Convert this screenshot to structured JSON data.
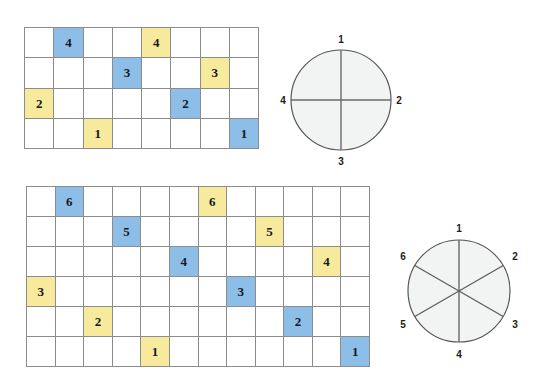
{
  "figure": {
    "palette": {
      "blue_fill": "#8cbee8",
      "yellow_fill": "#f8ea9d",
      "grid_line": "#8c8c8c",
      "circle_line": "#555555",
      "circle_fill": "#f2f4f4",
      "digit_color": "#15171c",
      "background": "#ffffff"
    }
  },
  "grid_top": {
    "name": "fourths-grid",
    "columns": 8,
    "rows": 4,
    "cells": [
      {
        "row": 1,
        "col": 1,
        "value": "",
        "fill": "none"
      },
      {
        "row": 1,
        "col": 2,
        "value": "4",
        "fill": "blue"
      },
      {
        "row": 1,
        "col": 3,
        "value": "",
        "fill": "none"
      },
      {
        "row": 1,
        "col": 4,
        "value": "",
        "fill": "none"
      },
      {
        "row": 1,
        "col": 5,
        "value": "4",
        "fill": "yellow"
      },
      {
        "row": 1,
        "col": 6,
        "value": "",
        "fill": "none"
      },
      {
        "row": 1,
        "col": 7,
        "value": "",
        "fill": "none"
      },
      {
        "row": 1,
        "col": 8,
        "value": "",
        "fill": "none"
      },
      {
        "row": 2,
        "col": 1,
        "value": "",
        "fill": "none"
      },
      {
        "row": 2,
        "col": 2,
        "value": "",
        "fill": "none"
      },
      {
        "row": 2,
        "col": 3,
        "value": "",
        "fill": "none"
      },
      {
        "row": 2,
        "col": 4,
        "value": "3",
        "fill": "blue"
      },
      {
        "row": 2,
        "col": 5,
        "value": "",
        "fill": "none"
      },
      {
        "row": 2,
        "col": 6,
        "value": "",
        "fill": "none"
      },
      {
        "row": 2,
        "col": 7,
        "value": "3",
        "fill": "yellow"
      },
      {
        "row": 2,
        "col": 8,
        "value": "",
        "fill": "none"
      },
      {
        "row": 3,
        "col": 1,
        "value": "2",
        "fill": "yellow"
      },
      {
        "row": 3,
        "col": 2,
        "value": "",
        "fill": "none"
      },
      {
        "row": 3,
        "col": 3,
        "value": "",
        "fill": "none"
      },
      {
        "row": 3,
        "col": 4,
        "value": "",
        "fill": "none"
      },
      {
        "row": 3,
        "col": 5,
        "value": "",
        "fill": "none"
      },
      {
        "row": 3,
        "col": 6,
        "value": "2",
        "fill": "blue"
      },
      {
        "row": 3,
        "col": 7,
        "value": "",
        "fill": "none"
      },
      {
        "row": 3,
        "col": 8,
        "value": "",
        "fill": "none"
      },
      {
        "row": 4,
        "col": 1,
        "value": "",
        "fill": "none"
      },
      {
        "row": 4,
        "col": 2,
        "value": "",
        "fill": "none"
      },
      {
        "row": 4,
        "col": 3,
        "value": "1",
        "fill": "yellow"
      },
      {
        "row": 4,
        "col": 4,
        "value": "",
        "fill": "none"
      },
      {
        "row": 4,
        "col": 5,
        "value": "",
        "fill": "none"
      },
      {
        "row": 4,
        "col": 6,
        "value": "",
        "fill": "none"
      },
      {
        "row": 4,
        "col": 7,
        "value": "",
        "fill": "none"
      },
      {
        "row": 4,
        "col": 8,
        "value": "1",
        "fill": "blue"
      }
    ]
  },
  "grid_bottom": {
    "name": "sixths-grid",
    "columns": 12,
    "rows": 6,
    "cells": [
      {
        "row": 1,
        "col": 1,
        "value": "",
        "fill": "none"
      },
      {
        "row": 1,
        "col": 2,
        "value": "6",
        "fill": "blue"
      },
      {
        "row": 1,
        "col": 3,
        "value": "",
        "fill": "none"
      },
      {
        "row": 1,
        "col": 4,
        "value": "",
        "fill": "none"
      },
      {
        "row": 1,
        "col": 5,
        "value": "",
        "fill": "none"
      },
      {
        "row": 1,
        "col": 6,
        "value": "",
        "fill": "none"
      },
      {
        "row": 1,
        "col": 7,
        "value": "6",
        "fill": "yellow"
      },
      {
        "row": 1,
        "col": 8,
        "value": "",
        "fill": "none"
      },
      {
        "row": 1,
        "col": 9,
        "value": "",
        "fill": "none"
      },
      {
        "row": 1,
        "col": 10,
        "value": "",
        "fill": "none"
      },
      {
        "row": 1,
        "col": 11,
        "value": "",
        "fill": "none"
      },
      {
        "row": 1,
        "col": 12,
        "value": "",
        "fill": "none"
      },
      {
        "row": 2,
        "col": 1,
        "value": "",
        "fill": "none"
      },
      {
        "row": 2,
        "col": 2,
        "value": "",
        "fill": "none"
      },
      {
        "row": 2,
        "col": 3,
        "value": "",
        "fill": "none"
      },
      {
        "row": 2,
        "col": 4,
        "value": "5",
        "fill": "blue"
      },
      {
        "row": 2,
        "col": 5,
        "value": "",
        "fill": "none"
      },
      {
        "row": 2,
        "col": 6,
        "value": "",
        "fill": "none"
      },
      {
        "row": 2,
        "col": 7,
        "value": "",
        "fill": "none"
      },
      {
        "row": 2,
        "col": 8,
        "value": "",
        "fill": "none"
      },
      {
        "row": 2,
        "col": 9,
        "value": "5",
        "fill": "yellow"
      },
      {
        "row": 2,
        "col": 10,
        "value": "",
        "fill": "none"
      },
      {
        "row": 2,
        "col": 11,
        "value": "",
        "fill": "none"
      },
      {
        "row": 2,
        "col": 12,
        "value": "",
        "fill": "none"
      },
      {
        "row": 3,
        "col": 1,
        "value": "",
        "fill": "none"
      },
      {
        "row": 3,
        "col": 2,
        "value": "",
        "fill": "none"
      },
      {
        "row": 3,
        "col": 3,
        "value": "",
        "fill": "none"
      },
      {
        "row": 3,
        "col": 4,
        "value": "",
        "fill": "none"
      },
      {
        "row": 3,
        "col": 5,
        "value": "",
        "fill": "none"
      },
      {
        "row": 3,
        "col": 6,
        "value": "4",
        "fill": "blue"
      },
      {
        "row": 3,
        "col": 7,
        "value": "",
        "fill": "none"
      },
      {
        "row": 3,
        "col": 8,
        "value": "",
        "fill": "none"
      },
      {
        "row": 3,
        "col": 9,
        "value": "",
        "fill": "none"
      },
      {
        "row": 3,
        "col": 10,
        "value": "",
        "fill": "none"
      },
      {
        "row": 3,
        "col": 11,
        "value": "4",
        "fill": "yellow"
      },
      {
        "row": 3,
        "col": 12,
        "value": "",
        "fill": "none"
      },
      {
        "row": 4,
        "col": 1,
        "value": "3",
        "fill": "yellow"
      },
      {
        "row": 4,
        "col": 2,
        "value": "",
        "fill": "none"
      },
      {
        "row": 4,
        "col": 3,
        "value": "",
        "fill": "none"
      },
      {
        "row": 4,
        "col": 4,
        "value": "",
        "fill": "none"
      },
      {
        "row": 4,
        "col": 5,
        "value": "",
        "fill": "none"
      },
      {
        "row": 4,
        "col": 6,
        "value": "",
        "fill": "none"
      },
      {
        "row": 4,
        "col": 7,
        "value": "",
        "fill": "none"
      },
      {
        "row": 4,
        "col": 8,
        "value": "3",
        "fill": "blue"
      },
      {
        "row": 4,
        "col": 9,
        "value": "",
        "fill": "none"
      },
      {
        "row": 4,
        "col": 10,
        "value": "",
        "fill": "none"
      },
      {
        "row": 4,
        "col": 11,
        "value": "",
        "fill": "none"
      },
      {
        "row": 4,
        "col": 12,
        "value": "",
        "fill": "none"
      },
      {
        "row": 5,
        "col": 1,
        "value": "",
        "fill": "none"
      },
      {
        "row": 5,
        "col": 2,
        "value": "",
        "fill": "none"
      },
      {
        "row": 5,
        "col": 3,
        "value": "2",
        "fill": "yellow"
      },
      {
        "row": 5,
        "col": 4,
        "value": "",
        "fill": "none"
      },
      {
        "row": 5,
        "col": 5,
        "value": "",
        "fill": "none"
      },
      {
        "row": 5,
        "col": 6,
        "value": "",
        "fill": "none"
      },
      {
        "row": 5,
        "col": 7,
        "value": "",
        "fill": "none"
      },
      {
        "row": 5,
        "col": 8,
        "value": "",
        "fill": "none"
      },
      {
        "row": 5,
        "col": 9,
        "value": "",
        "fill": "none"
      },
      {
        "row": 5,
        "col": 10,
        "value": "2",
        "fill": "blue"
      },
      {
        "row": 5,
        "col": 11,
        "value": "",
        "fill": "none"
      },
      {
        "row": 5,
        "col": 12,
        "value": "",
        "fill": "none"
      },
      {
        "row": 6,
        "col": 1,
        "value": "",
        "fill": "none"
      },
      {
        "row": 6,
        "col": 2,
        "value": "",
        "fill": "none"
      },
      {
        "row": 6,
        "col": 3,
        "value": "",
        "fill": "none"
      },
      {
        "row": 6,
        "col": 4,
        "value": "",
        "fill": "none"
      },
      {
        "row": 6,
        "col": 5,
        "value": "1",
        "fill": "yellow"
      },
      {
        "row": 6,
        "col": 6,
        "value": "",
        "fill": "none"
      },
      {
        "row": 6,
        "col": 7,
        "value": "",
        "fill": "none"
      },
      {
        "row": 6,
        "col": 8,
        "value": "",
        "fill": "none"
      },
      {
        "row": 6,
        "col": 9,
        "value": "",
        "fill": "none"
      },
      {
        "row": 6,
        "col": 10,
        "value": "",
        "fill": "none"
      },
      {
        "row": 6,
        "col": 11,
        "value": "",
        "fill": "none"
      },
      {
        "row": 6,
        "col": 12,
        "value": "1",
        "fill": "blue"
      }
    ]
  },
  "circle_top": {
    "name": "fourths-circle",
    "sectors": 4,
    "labels": [
      {
        "text": "1",
        "position": "top"
      },
      {
        "text": "2",
        "position": "right"
      },
      {
        "text": "3",
        "position": "bottom"
      },
      {
        "text": "4",
        "position": "left"
      }
    ]
  },
  "circle_bottom": {
    "name": "sixths-circle",
    "sectors": 6,
    "labels": [
      {
        "text": "1",
        "position": "top"
      },
      {
        "text": "2",
        "position": "upper-right"
      },
      {
        "text": "3",
        "position": "lower-right"
      },
      {
        "text": "4",
        "position": "bottom"
      },
      {
        "text": "5",
        "position": "lower-left"
      },
      {
        "text": "6",
        "position": "upper-left"
      }
    ]
  }
}
